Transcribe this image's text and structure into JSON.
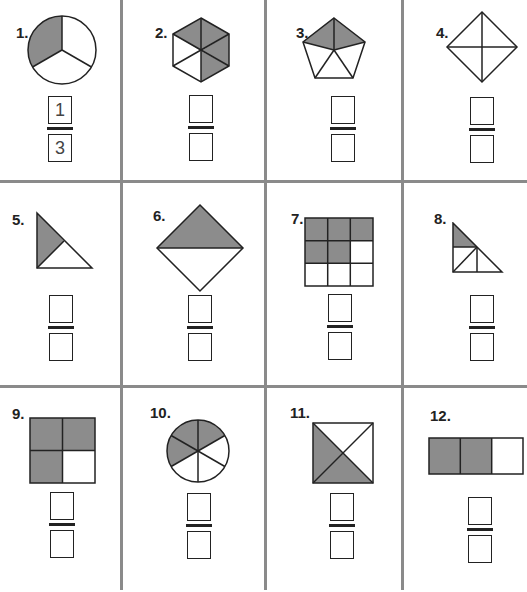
{
  "worksheet": {
    "shade_color": "#8c8c8c",
    "line_color": "#222222",
    "grid_color": "#8a8a8a",
    "problems": [
      {
        "number": "1.",
        "shape": "circle",
        "parts": 3,
        "shaded": 1,
        "numerator": "1",
        "denominator": "3"
      },
      {
        "number": "2.",
        "shape": "hexagon",
        "parts": 6,
        "shaded": 4,
        "numerator": "",
        "denominator": ""
      },
      {
        "number": "3.",
        "shape": "pentagon",
        "parts": 5,
        "shaded": 2,
        "numerator": "",
        "denominator": ""
      },
      {
        "number": "4.",
        "shape": "diamond",
        "parts": 4,
        "shaded": 0,
        "numerator": "",
        "denominator": ""
      },
      {
        "number": "5.",
        "shape": "right-triangle",
        "parts": 2,
        "shaded": 1,
        "numerator": "",
        "denominator": ""
      },
      {
        "number": "6.",
        "shape": "diamond-halves",
        "parts": 2,
        "shaded": 1,
        "numerator": "",
        "denominator": ""
      },
      {
        "number": "7.",
        "shape": "square-grid-3x3",
        "parts": 9,
        "shaded": 5,
        "numerator": "",
        "denominator": ""
      },
      {
        "number": "8.",
        "shape": "right-triangle-quarters",
        "parts": 4,
        "shaded": 1,
        "numerator": "",
        "denominator": ""
      },
      {
        "number": "9.",
        "shape": "square-grid-2x2",
        "parts": 4,
        "shaded": 3,
        "numerator": "",
        "denominator": ""
      },
      {
        "number": "10.",
        "shape": "circle",
        "parts": 6,
        "shaded": 3,
        "numerator": "",
        "denominator": ""
      },
      {
        "number": "11.",
        "shape": "square-diagonals",
        "parts": 4,
        "shaded": 2,
        "numerator": "",
        "denominator": ""
      },
      {
        "number": "12.",
        "shape": "rectangle-thirds",
        "parts": 3,
        "shaded": 2,
        "numerator": "",
        "denominator": ""
      }
    ]
  }
}
